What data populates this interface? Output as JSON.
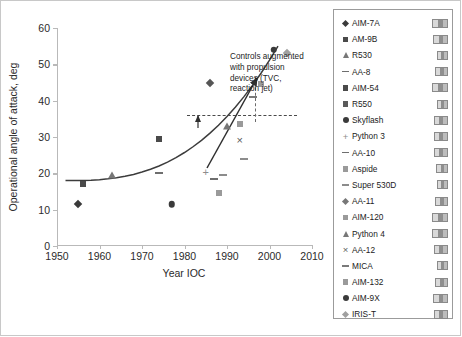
{
  "chart_data": {
    "type": "scatter",
    "title": "",
    "xlabel": "Year IOC",
    "ylabel": "Operational angle of attack, deg",
    "xlim": [
      1950,
      2010
    ],
    "ylim": [
      0,
      60
    ],
    "xticks": [
      1950,
      1960,
      1970,
      1980,
      1990,
      2000,
      2010
    ],
    "yticks": [
      0,
      10,
      20,
      30,
      40,
      50,
      60
    ],
    "grid": false,
    "legend_position": "right",
    "points": [
      {
        "name": "AIM-7A",
        "x": 1955,
        "y": 11.5,
        "marker": "diamond",
        "color": "#3a3a3a"
      },
      {
        "name": "AM-9B",
        "x": 1956,
        "y": 17.0,
        "marker": "square",
        "color": "#4a4a4a"
      },
      {
        "name": "R530",
        "x": 1963,
        "y": 19.5,
        "marker": "triangle",
        "color": "#777777"
      },
      {
        "name": "AA-8",
        "x": 1974,
        "y": 20.0,
        "marker": "dash",
        "color": "#6e6e6e"
      },
      {
        "name": "AIM-54",
        "x": 1974,
        "y": 29.5,
        "marker": "square",
        "color": "#4a4a4a"
      },
      {
        "name": "R550",
        "x": 1977,
        "y": 11.5,
        "marker": "circle",
        "color": "#3a3a3a"
      },
      {
        "name": "Skyflash",
        "x": 1986,
        "y": 45.0,
        "marker": "diamond",
        "color": "#555555"
      },
      {
        "name": "Python 3",
        "x": 1985,
        "y": 20.0,
        "marker": "plus",
        "color": "#8c8c8c"
      },
      {
        "name": "AA-10",
        "x": 1987,
        "y": 18.5,
        "marker": "dash",
        "color": "#6e6e6e"
      },
      {
        "name": "Aspide",
        "x": 1988,
        "y": 14.5,
        "marker": "square",
        "color": "#9a9a9a"
      },
      {
        "name": "Super 530D",
        "x": 1989,
        "y": 19.5,
        "marker": "dash",
        "color": "#8c8c8c"
      },
      {
        "name": "AA-11",
        "x": 1990,
        "y": 33.0,
        "marker": "triangle",
        "color": "#777777"
      },
      {
        "name": "AIM-120",
        "x": 1993,
        "y": 33.5,
        "marker": "square",
        "color": "#9a9a9a"
      },
      {
        "name": "Python 4",
        "x": 1993,
        "y": 29.0,
        "marker": "cross",
        "color": "#5a5a5a"
      },
      {
        "name": "AA-12",
        "x": 1994,
        "y": 24.0,
        "marker": "dash",
        "color": "#8c8c8c"
      },
      {
        "name": "MICA",
        "x": 1996,
        "y": 41.0,
        "marker": "dash",
        "color": "#7a7a7a"
      },
      {
        "name": "AIM-132",
        "x": 1998,
        "y": 44.5,
        "marker": "square",
        "color": "#9a9a9a"
      },
      {
        "name": "AIM-9X",
        "x": 2001,
        "y": 54.0,
        "marker": "circle",
        "color": "#3a3a3a"
      },
      {
        "name": "IRIS-T",
        "x": 2004,
        "y": 53.0,
        "marker": "diamond",
        "color": "#a0a0a0"
      }
    ],
    "trend_curve": {
      "label": "trend",
      "color": "#3c3c3c"
    },
    "reference_line": {
      "type": "horizontal-dashed",
      "y": 35
    },
    "annotation": {
      "text": "Controls augmented with propulsion devices (TVC, reaction jet)",
      "line1": "Controls augmented",
      "line2": "with propulsion",
      "line3": "devices (TVC,",
      "line4": "reaction jet)"
    }
  },
  "axes": {
    "y_title": "Operational angle of attack, deg",
    "x_title": "Year IOC",
    "y_labels": [
      "60",
      "50",
      "40",
      "30",
      "20",
      "10",
      "0"
    ],
    "x_labels": [
      "1950",
      "1960",
      "1970",
      "1980",
      "1990",
      "2000",
      "2010"
    ]
  },
  "legend": {
    "items": [
      {
        "label": "AIM-7A",
        "marker": "diamond",
        "color": "#3a3a3a",
        "thumb": "missile-thumb",
        "thumb_w": 16
      },
      {
        "label": "AM-9B",
        "marker": "square",
        "color": "#4a4a4a",
        "thumb": "missile-thumb",
        "thumb_w": 15
      },
      {
        "label": "R530",
        "marker": "triangle",
        "color": "#777777",
        "thumb": "missile-thumb",
        "thumb_w": 11
      },
      {
        "label": "AA-8",
        "marker": "dash",
        "color": "#6e6e6e",
        "thumb": "missile-thumb",
        "thumb_w": 13
      },
      {
        "label": "AIM-54",
        "marker": "square",
        "color": "#4a4a4a",
        "thumb": "missile-thumb",
        "thumb_w": 16
      },
      {
        "label": "R550",
        "marker": "square",
        "color": "#5a5a5a",
        "thumb": "missile-thumb",
        "thumb_w": 11
      },
      {
        "label": "Skyflash",
        "marker": "circle",
        "color": "#3a3a3a",
        "thumb": "missile-thumb",
        "thumb_w": 14
      },
      {
        "label": "Python 3",
        "marker": "plus",
        "color": "#8c8c8c",
        "thumb": "missile-thumb",
        "thumb_w": 14
      },
      {
        "label": "AA-10",
        "marker": "dash",
        "color": "#6e6e6e",
        "thumb": "missile-thumb",
        "thumb_w": 14
      },
      {
        "label": "Aspide",
        "marker": "square",
        "color": "#9a9a9a",
        "thumb": "missile-thumb",
        "thumb_w": 12
      },
      {
        "label": "Super 530D",
        "marker": "dash",
        "color": "#8c8c8c",
        "thumb": "missile-thumb",
        "thumb_w": 11
      },
      {
        "label": "AA-11",
        "marker": "diamond",
        "color": "#777777",
        "thumb": "missile-thumb",
        "thumb_w": 13
      },
      {
        "label": "AIM-120",
        "marker": "square",
        "color": "#9a9a9a",
        "thumb": "missile-thumb",
        "thumb_w": 16
      },
      {
        "label": "Python 4",
        "marker": "triangle",
        "color": "#777777",
        "thumb": "missile-thumb",
        "thumb_w": 16
      },
      {
        "label": "AA-12",
        "marker": "cross",
        "color": "#5a5a5a",
        "thumb": "missile-thumb",
        "thumb_w": 14
      },
      {
        "label": "MICA",
        "marker": "dash",
        "color": "#7a7a7a",
        "thumb": "missile-thumb",
        "thumb_w": 11
      },
      {
        "label": "AIM-132",
        "marker": "square",
        "color": "#9a9a9a",
        "thumb": "missile-thumb",
        "thumb_w": 13
      },
      {
        "label": "AIM-9X",
        "marker": "circle",
        "color": "#3a3a3a",
        "thumb": "missile-thumb",
        "thumb_w": 15
      },
      {
        "label": "IRIS-T",
        "marker": "diamond",
        "color": "#a0a0a0",
        "thumb": "missile-thumb",
        "thumb_w": 14
      }
    ]
  }
}
